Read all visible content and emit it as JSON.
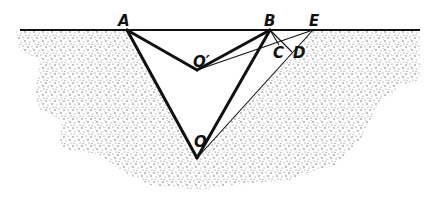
{
  "diagram": {
    "type": "geometry-figure",
    "points": {
      "A": {
        "label": "A",
        "x": 127,
        "y": 30
      },
      "B": {
        "label": "B",
        "x": 270,
        "y": 30
      },
      "E": {
        "label": "E",
        "x": 313,
        "y": 30
      },
      "O_prime": {
        "label": "O′",
        "x": 197,
        "y": 70
      },
      "O": {
        "label": "O",
        "x": 197,
        "y": 158
      },
      "C": {
        "label": "C",
        "x": 282,
        "y": 47
      },
      "D": {
        "label": "D",
        "x": 291,
        "y": 52
      }
    },
    "labels": {
      "A": "A",
      "B": "B",
      "E": "E",
      "C": "C",
      "D": "D",
      "O_prime": "O′",
      "O": "O"
    },
    "segments": [
      {
        "from": "surface-left",
        "to": "surface-right",
        "weight": "medium"
      },
      {
        "from": "A",
        "to": "O",
        "weight": "thick"
      },
      {
        "from": "O",
        "to": "B",
        "weight": "thick"
      },
      {
        "from": "A",
        "to": "O_prime",
        "weight": "thick"
      },
      {
        "from": "O_prime",
        "to": "B",
        "weight": "thick"
      },
      {
        "from": "O_prime",
        "to": "E",
        "weight": "thin"
      },
      {
        "from": "O",
        "to": "E",
        "weight": "thin"
      },
      {
        "from": "B",
        "to": "C",
        "weight": "thin"
      },
      {
        "from": "B",
        "to": "D",
        "weight": "thin"
      }
    ],
    "colors": {
      "ink": "#111111",
      "stipple": "#555555",
      "background": "#ffffff"
    }
  }
}
